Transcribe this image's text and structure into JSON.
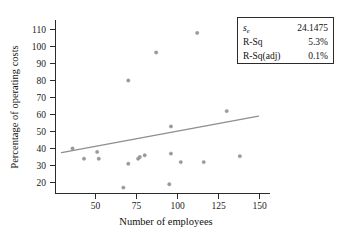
{
  "chart_data": {
    "type": "scatter",
    "title": "",
    "xlabel": "Number of employees",
    "ylabel": "Percentage of operating costs",
    "xlim": [
      30,
      160
    ],
    "ylim": [
      14,
      114
    ],
    "xticks": [
      50,
      75,
      100,
      125,
      150
    ],
    "yticks": [
      20,
      30,
      40,
      50,
      60,
      70,
      80,
      90,
      100,
      110
    ],
    "grid": false,
    "legend_position": "top-right",
    "point_color": "#9a9a9a",
    "line_color": "#8e8e8e",
    "axis_color": "#2b2b2b",
    "x": [
      36,
      43,
      51,
      52,
      67,
      70,
      70,
      76,
      77,
      80,
      87,
      95,
      96,
      96,
      102,
      112,
      116,
      130,
      138
    ],
    "y": [
      40,
      34,
      38,
      34,
      17,
      31,
      80,
      34,
      35,
      36,
      96.5,
      19,
      37,
      53,
      32,
      108,
      32,
      62,
      35.5
    ],
    "fit_line": {
      "x_start": 34,
      "y_start": 34.5,
      "x_end": 154,
      "y_end": 56.0
    }
  },
  "axis": {
    "y_tick_labels": [
      "110",
      "100",
      "90",
      "80",
      "70",
      "60",
      "50",
      "40",
      "30",
      "20"
    ],
    "x_tick_labels": [
      "50",
      "75",
      "100",
      "125",
      "150"
    ],
    "x_title": "Number of employees",
    "y_title": "Percentage of operating costs"
  },
  "legend": {
    "rows": [
      {
        "label": "s",
        "sub": "e",
        "value": "24.1475",
        "italic": true
      },
      {
        "label": "R-Sq",
        "sub": "",
        "value": "5.3%",
        "italic": false
      },
      {
        "label": "R-Sq(adj)",
        "sub": "",
        "value": "0.1%",
        "italic": false
      }
    ]
  }
}
